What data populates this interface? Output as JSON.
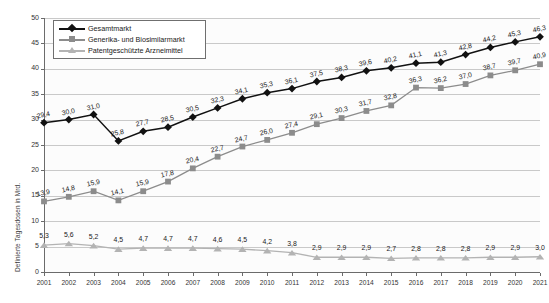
{
  "chart_data": {
    "type": "line",
    "title": "",
    "xlabel": "",
    "ylabel": "Definierte Tagesdosen in Mrd.",
    "ylim": [
      0,
      50
    ],
    "ytick_step": 5,
    "yticks": [
      "0",
      "5",
      "10",
      "15",
      "20",
      "25",
      "30",
      "35",
      "40",
      "45",
      "50"
    ],
    "grid": true,
    "legend_position": "top-left",
    "categories": [
      "2001",
      "2002",
      "2003",
      "2004",
      "2005",
      "2006",
      "2007",
      "2008",
      "2009",
      "2010",
      "2011",
      "2012",
      "2013",
      "2014",
      "2015",
      "2016",
      "2017",
      "2018",
      "2019",
      "2020",
      "2021"
    ],
    "series": [
      {
        "name": "Gesamtmarkt",
        "marker": "diamond",
        "color": "#111111",
        "values": [
          29.4,
          30.0,
          31.0,
          25.8,
          27.7,
          28.5,
          30.5,
          32.3,
          34.1,
          35.3,
          36.1,
          37.5,
          38.3,
          39.6,
          40.2,
          41.1,
          41.3,
          42.8,
          44.2,
          45.3,
          46.3
        ],
        "labels": [
          "29,4",
          "30,0",
          "31,0",
          "25,8",
          "27,7",
          "28,5",
          "30,5",
          "32,3",
          "34,1",
          "35,3",
          "36,1",
          "37,5",
          "38,3",
          "39,6",
          "40,2",
          "41,1",
          "41,3",
          "42,8",
          "44,2",
          "45,3",
          "46,3"
        ]
      },
      {
        "name": "Generika- und Biosimilarmarkt",
        "marker": "square",
        "color": "#8c8c8c",
        "values": [
          13.9,
          14.8,
          15.9,
          14.1,
          15.9,
          17.8,
          20.4,
          22.7,
          24.7,
          26.0,
          27.4,
          29.1,
          30.3,
          31.7,
          32.8,
          36.3,
          36.2,
          37.0,
          38.7,
          39.7,
          40.9
        ],
        "labels": [
          "13,9",
          "14,8",
          "15,9",
          "14,1",
          "15,9",
          "17,8",
          "20,4",
          "22,7",
          "24,7",
          "26,0",
          "27,4",
          "29,1",
          "30,3",
          "31,7",
          "32,8",
          "36,3",
          "36,2",
          "37,0",
          "38,7",
          "39,7",
          "40,9"
        ]
      },
      {
        "name": "Patentgeschützte Arzneimittel",
        "marker": "triangle",
        "color": "#b3b3b3",
        "values": [
          5.3,
          5.6,
          5.2,
          4.5,
          4.7,
          4.7,
          4.7,
          4.6,
          4.5,
          4.2,
          3.8,
          2.9,
          2.9,
          2.9,
          2.7,
          2.8,
          2.8,
          2.8,
          2.9,
          2.9,
          3.0
        ],
        "labels": [
          "5,3",
          "5,6",
          "5,2",
          "4,5",
          "4,7",
          "4,7",
          "4,7",
          "4,6",
          "4,5",
          "4,2",
          "3,8",
          "2,9",
          "2,9",
          "2,9",
          "2,7",
          "2,8",
          "2,8",
          "2,8",
          "2,9",
          "2,9",
          "3,0"
        ]
      }
    ]
  },
  "legend": {
    "items": [
      {
        "label": "Gesamtmarkt",
        "icon": "diamond-marker-icon"
      },
      {
        "label": "Generika- und Biosimilarmarkt",
        "icon": "square-marker-icon"
      },
      {
        "label": "Patentgeschützte Arzneimittel",
        "icon": "triangle-marker-icon"
      }
    ]
  }
}
